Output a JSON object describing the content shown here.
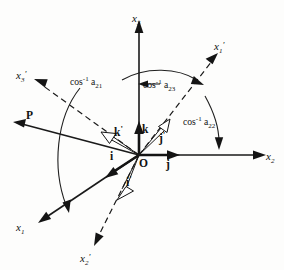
{
  "figure": {
    "background_color": "#fdfdfc",
    "ink_color": "#141414"
  },
  "axes": [
    {
      "id": "x3",
      "label": "x",
      "subscript": "3",
      "prime": "",
      "style": "solid",
      "name": "axis-x3"
    },
    {
      "id": "x2",
      "label": "x",
      "subscript": "2",
      "prime": "",
      "style": "solid",
      "name": "axis-x2"
    },
    {
      "id": "x1",
      "label": "x",
      "subscript": "1",
      "prime": "",
      "style": "solid",
      "name": "axis-x1"
    },
    {
      "id": "x1prime",
      "label": "x",
      "subscript": "1",
      "prime": "'",
      "style": "dashed",
      "name": "axis-x1-prime"
    },
    {
      "id": "x2prime",
      "label": "x",
      "subscript": "2",
      "prime": "'",
      "style": "dashed",
      "name": "axis-x2-prime"
    },
    {
      "id": "x3prime",
      "label": "x",
      "subscript": "3",
      "prime": "'",
      "style": "dashed",
      "name": "axis-x3-prime"
    }
  ],
  "origin": {
    "label": "O"
  },
  "unit_vectors": [
    {
      "id": "i",
      "label": "i",
      "prime": "",
      "head": "solid",
      "name": "unit-vector-i"
    },
    {
      "id": "j",
      "label": "j",
      "prime": "",
      "head": "solid",
      "name": "unit-vector-j"
    },
    {
      "id": "k",
      "label": "k",
      "prime": "",
      "head": "solid",
      "name": "unit-vector-k"
    },
    {
      "id": "iprime",
      "label": "i",
      "prime": "'",
      "head": "hollow",
      "name": "unit-vector-i-prime"
    },
    {
      "id": "jprime",
      "label": "j",
      "prime": "'",
      "head": "hollow",
      "name": "unit-vector-j-prime"
    },
    {
      "id": "kprime",
      "label": "k",
      "prime": "'",
      "head": "hollow",
      "name": "unit-vector-k-prime"
    }
  ],
  "vector_p": {
    "label": "P",
    "name": "vector-p"
  },
  "angle_labels": [
    {
      "id": "angle_left",
      "text": "cos",
      "superscript": "-1",
      "coefficient": "a",
      "subscript": "21",
      "name": "angle-label-cos-inv-a21"
    },
    {
      "id": "angle_middle",
      "text": "cos",
      "superscript": "-1",
      "coefficient": "a",
      "subscript": "23",
      "name": "angle-label-cos-inv-a23"
    },
    {
      "id": "angle_right",
      "text": "cos",
      "superscript": "-1",
      "coefficient": "a",
      "subscript": "22",
      "name": "angle-label-cos-inv-a22"
    }
  ]
}
